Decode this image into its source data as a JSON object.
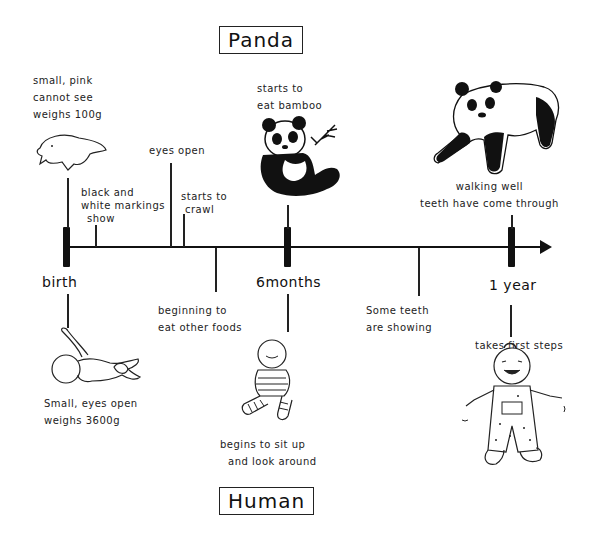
{
  "titles": {
    "top": "Panda",
    "bottom": "Human"
  },
  "timeline": {
    "milestones": [
      {
        "label": "birth"
      },
      {
        "label": "6months"
      },
      {
        "label": "1 year"
      }
    ]
  },
  "panda_notes": {
    "birth": [
      "small, pink",
      "cannot see",
      "weighs 100g"
    ],
    "markings": [
      "black and",
      "white markings",
      "show"
    ],
    "eyes": [
      "eyes open"
    ],
    "crawl": [
      "starts to",
      "crawl"
    ],
    "bamboo": [
      "starts to",
      "eat bamboo"
    ],
    "walking": [
      "walking well",
      "teeth have come through"
    ]
  },
  "human_notes": {
    "birth": [
      "Small, eyes open",
      "weighs 3600g"
    ],
    "foods": [
      "beginning to",
      "eat other foods"
    ],
    "sit": [
      "begins to sit up",
      "and look around"
    ],
    "teeth": [
      "Some teeth",
      "are showing"
    ],
    "steps": [
      "takes first steps"
    ]
  },
  "illustrations": {
    "panda_newborn": "newborn-panda-cub",
    "panda_6m": "sitting-panda-with-bamboo",
    "panda_1y": "walking-panda-cub",
    "human_newborn": "newborn-baby",
    "human_6m": "sitting-baby",
    "human_1y": "toddler-walking"
  }
}
